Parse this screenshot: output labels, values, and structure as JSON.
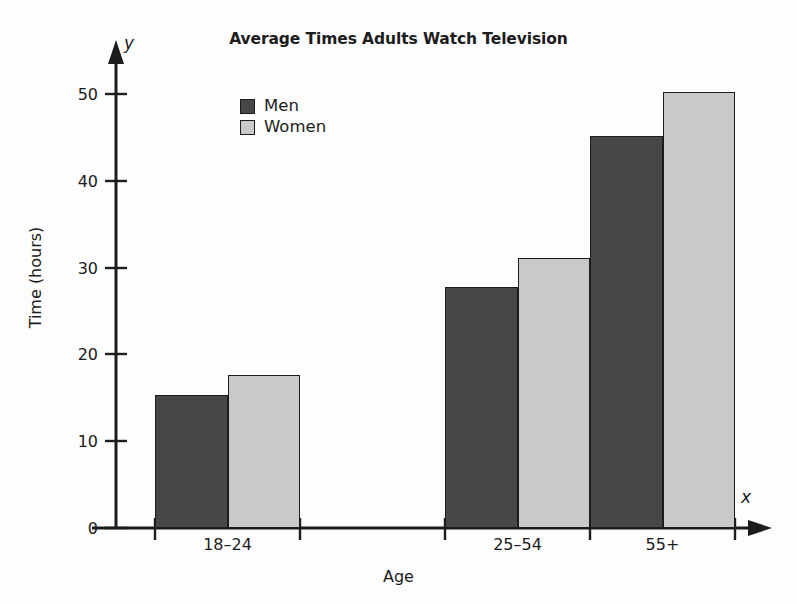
{
  "chart_data": {
    "type": "bar",
    "title": "Average Times Adults Watch Television",
    "xlabel": "Age",
    "ylabel": "Time (hours)",
    "x_axis_variable": "x",
    "y_axis_variable": "y",
    "categories": [
      "18–24",
      "25–54",
      "55+"
    ],
    "series": [
      {
        "name": "Men",
        "color": "#474747",
        "values": [
          15.3,
          27.8,
          45.2
        ]
      },
      {
        "name": "Women",
        "color": "#c9c9c9",
        "values": [
          17.6,
          31.1,
          50.2
        ]
      }
    ],
    "ylim": [
      0,
      53
    ],
    "yticks": [
      "0",
      "10",
      "20",
      "30",
      "40",
      "50"
    ],
    "ytick_values": [
      0,
      10,
      20,
      30,
      40,
      50
    ],
    "grid": false,
    "legend_position": "top-left-inside",
    "axis_style": "arrowed"
  },
  "colors": {
    "men": "#474747",
    "women": "#c9c9c9",
    "axis": "#1c1c1c",
    "background": "#fdfdfd",
    "bar_outline": "#1c1c1c"
  }
}
